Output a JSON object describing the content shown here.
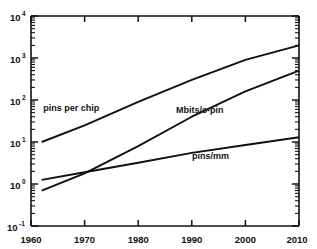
{
  "chart_data": {
    "type": "line",
    "title": "",
    "subtitle": "",
    "xlabel": "",
    "ylabel": "",
    "xlim": [
      1960,
      2010
    ],
    "ylim": [
      0.1,
      10000
    ],
    "yscale": "log",
    "xscale": "linear",
    "grid": false,
    "legend_position": "inline-annotations",
    "xticks": [
      1960,
      1970,
      1980,
      1990,
      2000,
      2010
    ],
    "xtick_labels": [
      "1960",
      "1970",
      "1980",
      "1990",
      "2000",
      "2010"
    ],
    "yticks": [
      0.1,
      1,
      10,
      100,
      1000,
      10000
    ],
    "ytick_labels": [
      "10",
      "10",
      "10",
      "10",
      "10",
      "10"
    ],
    "ytick_exponents": [
      "-1",
      "0",
      "1",
      "2",
      "3",
      "4"
    ],
    "series": [
      {
        "name": "pins per chip",
        "x": [
          1962,
          1970,
          1980,
          1990,
          2000,
          2010
        ],
        "values": [
          10,
          25,
          90,
          300,
          900,
          2000
        ]
      },
      {
        "name": "Mbits/s-pin",
        "x": [
          1962,
          1970,
          1980,
          1990,
          2000,
          2010
        ],
        "values": [
          0.7,
          1.8,
          8,
          40,
          160,
          500
        ]
      },
      {
        "name": "pins/mm",
        "x": [
          1962,
          1970,
          1980,
          1990,
          2000,
          2010
        ],
        "values": [
          1.25,
          1.9,
          3.2,
          5.5,
          8.5,
          13
        ]
      }
    ],
    "annotations": [
      {
        "text": "pins per chip",
        "x": 1967.5,
        "y": 55
      },
      {
        "text": "Mbits/s-pin",
        "x": 1991.5,
        "y": 48
      },
      {
        "text": "pins/mm",
        "x": 1993.5,
        "y": 4.0
      }
    ]
  },
  "axis": {
    "ytick_base": "10"
  }
}
